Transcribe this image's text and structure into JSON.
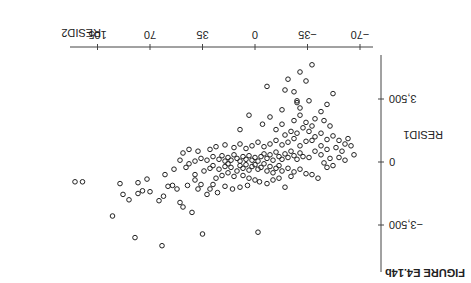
{
  "figure": {
    "label": "FIGURE E4.14b",
    "rotation_deg": 180
  },
  "chart_data": {
    "type": "scatter",
    "title": "FIGURE E4.14b",
    "xlabel": "RESID2",
    "ylabel": "RESID1",
    "xticks": [
      -70,
      -35,
      0,
      35,
      70,
      105
    ],
    "xtick_labels": [
      "−70",
      "−35",
      "0",
      "35",
      "70",
      "105"
    ],
    "yticks": [
      -3500,
      0,
      3500
    ],
    "ytick_labels": [
      "−3,500",
      "0",
      "3,500"
    ],
    "xlim": [
      -77,
      125
    ],
    "ylim": [
      -6000,
      6000
    ],
    "grid": false,
    "marker": "open-circle",
    "points": [
      [
        115,
        -1100
      ],
      [
        80,
        -4200
      ],
      [
        62,
        -4650
      ],
      [
        120,
        -1100
      ],
      [
        84,
        -2100
      ],
      [
        95,
        -3000
      ],
      [
        72,
        -950
      ],
      [
        55,
        -1300
      ],
      [
        75,
        -1600
      ],
      [
        88,
        -1800
      ],
      [
        90,
        -1200
      ],
      [
        78,
        -1150
      ],
      [
        64,
        -2150
      ],
      [
        78,
        -1750
      ],
      [
        70,
        -1650
      ],
      [
        61,
        -1900
      ],
      [
        50,
        -2250
      ],
      [
        52,
        -1500
      ],
      [
        40,
        -1000
      ],
      [
        38,
        -1500
      ],
      [
        35,
        -4000
      ],
      [
        -2,
        -3900
      ],
      [
        42,
        -2800
      ],
      [
        48,
        -2500
      ],
      [
        58,
        -1350
      ],
      [
        45,
        -1300
      ],
      [
        36,
        -1250
      ],
      [
        30,
        -1500
      ],
      [
        25,
        -1700
      ],
      [
        32,
        -1800
      ],
      [
        28,
        -1250
      ],
      [
        20,
        -1350
      ],
      [
        15,
        -1500
      ],
      [
        10,
        -1400
      ],
      [
        5,
        -1300
      ],
      [
        26,
        -900
      ],
      [
        22,
        -750
      ],
      [
        18,
        -600
      ],
      [
        14,
        -800
      ],
      [
        8,
        -750
      ],
      [
        4,
        -900
      ],
      [
        0,
        -1000
      ],
      [
        -3,
        -1100
      ],
      [
        -8,
        -1200
      ],
      [
        -12,
        -1000
      ],
      [
        -16,
        -900
      ],
      [
        -20,
        -1400
      ],
      [
        -24,
        -800
      ],
      [
        40,
        -700
      ],
      [
        34,
        -500
      ],
      [
        30,
        -350
      ],
      [
        28,
        -200
      ],
      [
        24,
        -400
      ],
      [
        20,
        -250
      ],
      [
        18,
        -100
      ],
      [
        16,
        -300
      ],
      [
        12,
        -500
      ],
      [
        10,
        -200
      ],
      [
        8,
        -350
      ],
      [
        6,
        -150
      ],
      [
        4,
        -450
      ],
      [
        2,
        -250
      ],
      [
        0,
        -150
      ],
      [
        -2,
        -400
      ],
      [
        -4,
        -300
      ],
      [
        -6,
        -100
      ],
      [
        -8,
        -500
      ],
      [
        -10,
        -250
      ],
      [
        -12,
        -600
      ],
      [
        -14,
        -350
      ],
      [
        -16,
        -200
      ],
      [
        -18,
        -500
      ],
      [
        -22,
        -350
      ],
      [
        -26,
        -550
      ],
      [
        -30,
        -400
      ],
      [
        -34,
        -650
      ],
      [
        -38,
        -700
      ],
      [
        -42,
        -900
      ],
      [
        60,
        -700
      ],
      [
        54,
        -400
      ],
      [
        46,
        -300
      ],
      [
        44,
        -100
      ],
      [
        40,
        50
      ],
      [
        36,
        200
      ],
      [
        32,
        100
      ],
      [
        28,
        300
      ],
      [
        24,
        150
      ],
      [
        22,
        350
      ],
      [
        20,
        50
      ],
      [
        18,
        250
      ],
      [
        16,
        100
      ],
      [
        14,
        400
      ],
      [
        12,
        200
      ],
      [
        10,
        50
      ],
      [
        8,
        300
      ],
      [
        6,
        150
      ],
      [
        4,
        350
      ],
      [
        2,
        100
      ],
      [
        0,
        250
      ],
      [
        -2,
        50
      ],
      [
        -4,
        300
      ],
      [
        -6,
        450
      ],
      [
        -8,
        200
      ],
      [
        -10,
        400
      ],
      [
        -12,
        100
      ],
      [
        -14,
        550
      ],
      [
        -16,
        300
      ],
      [
        -18,
        150
      ],
      [
        -20,
        450
      ],
      [
        -22,
        250
      ],
      [
        -24,
        600
      ],
      [
        -26,
        350
      ],
      [
        -28,
        150
      ],
      [
        -30,
        500
      ],
      [
        -32,
        300
      ],
      [
        -36,
        250
      ],
      [
        -40,
        600
      ],
      [
        -44,
        400
      ],
      [
        50,
        100
      ],
      [
        48,
        500
      ],
      [
        44,
        700
      ],
      [
        38,
        600
      ],
      [
        30,
        700
      ],
      [
        26,
        850
      ],
      [
        20,
        950
      ],
      [
        14,
        800
      ],
      [
        10,
        1000
      ],
      [
        6,
        750
      ],
      [
        2,
        900
      ],
      [
        -2,
        1100
      ],
      [
        -6,
        850
      ],
      [
        -10,
        1000
      ],
      [
        -14,
        1200
      ],
      [
        -18,
        950
      ],
      [
        -22,
        1100
      ],
      [
        -26,
        1300
      ],
      [
        -30,
        900
      ],
      [
        -34,
        1150
      ],
      [
        -20,
        1500
      ],
      [
        -24,
        1700
      ],
      [
        -28,
        1600
      ],
      [
        -32,
        1900
      ],
      [
        -36,
        1700
      ],
      [
        -40,
        1400
      ],
      [
        -44,
        1600
      ],
      [
        -48,
        1250
      ],
      [
        -52,
        1450
      ],
      [
        -56,
        1200
      ],
      [
        -60,
        1000
      ],
      [
        -62,
        1300
      ],
      [
        -14,
        1800
      ],
      [
        -18,
        2100
      ],
      [
        -26,
        2300
      ],
      [
        -30,
        2600
      ],
      [
        -34,
        2200
      ],
      [
        -38,
        2000
      ],
      [
        -40,
        2400
      ],
      [
        -44,
        2800
      ],
      [
        -46,
        2300
      ],
      [
        -48,
        3200
      ],
      [
        -50,
        2000
      ],
      [
        -52,
        3800
      ],
      [
        -36,
        3400
      ],
      [
        -30,
        3000
      ],
      [
        -5,
        2100
      ],
      [
        -10,
        2500
      ],
      [
        -18,
        2900
      ],
      [
        -28,
        3300
      ],
      [
        -20,
        4000
      ],
      [
        -8,
        4200
      ],
      [
        10,
        1800
      ],
      [
        4,
        2600
      ],
      [
        -22,
        4600
      ],
      [
        -28,
        3400
      ],
      [
        -34,
        4500
      ],
      [
        -38,
        5400
      ],
      [
        -30,
        5000
      ],
      [
        -26,
        3900
      ],
      [
        -54,
        800
      ],
      [
        -58,
        600
      ],
      [
        -64,
        900
      ],
      [
        -66,
        400
      ],
      [
        -56,
        250
      ],
      [
        -60,
        100
      ],
      [
        -50,
        200
      ],
      [
        -46,
        -50
      ],
      [
        -48,
        -300
      ],
      [
        -52,
        -200
      ],
      [
        -38,
        1200
      ],
      [
        -44,
        900
      ],
      [
        -48,
        700
      ]
    ]
  }
}
